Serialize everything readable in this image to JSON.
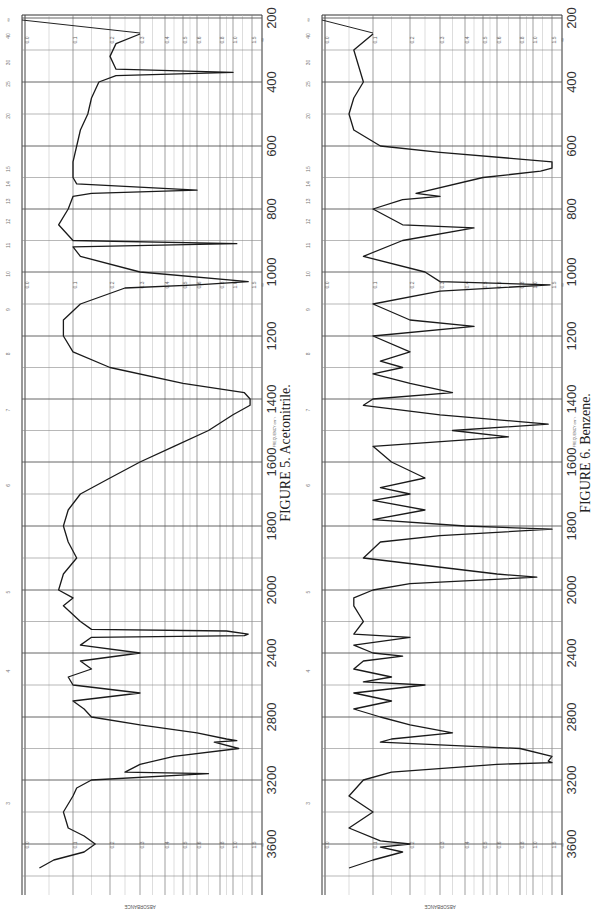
{
  "page": {
    "figures": [
      {
        "caption": "FIGURE 5.   Acetonitrile.",
        "compound": "Acetonitrile"
      },
      {
        "caption": "FIGURE 6.   Benzene.",
        "compound": "Benzene"
      }
    ],
    "frequency_axis_title": "FREQUENCY cm⁻¹",
    "absorbance_axis_title": "ABSORBANCE",
    "frequency_ticks": [
      "200",
      "400",
      "600",
      "800",
      "1000",
      "1200",
      "1400",
      "1600",
      "1800",
      "2000",
      "2400",
      "2800",
      "3200",
      "3600"
    ],
    "absorbance_ticks": [
      "0.0",
      "0.1",
      "0.2",
      "0.3",
      "0.4",
      "0.5",
      "0.6",
      "0.8",
      "1.0",
      "1.5",
      "∞"
    ],
    "micron_ticks": [
      "∞",
      "40",
      "30",
      "25",
      "20",
      "15",
      "14",
      "13",
      "12",
      "11",
      "10",
      "9",
      "8",
      "7",
      "6",
      "5",
      "4",
      "3"
    ]
  },
  "chart_data": [
    {
      "type": "line",
      "title": "FIGURE 5. Acetonitrile.",
      "xlabel": "FREQUENCY cm⁻¹",
      "ylabel": "ABSORBANCE",
      "orientation": "rotated 90° (frequency vertical, absorbance horizontal)",
      "x_ticks": [
        200,
        400,
        600,
        800,
        1000,
        1200,
        1400,
        1600,
        1800,
        2000,
        2400,
        2800,
        3200,
        3600
      ],
      "y_ticks": [
        0.0,
        0.1,
        0.2,
        0.3,
        0.4,
        0.5,
        0.6,
        0.8,
        1.0,
        1.5
      ],
      "xlim": [
        200,
        3800
      ],
      "ylim": [
        0.0,
        "∞"
      ],
      "grid": true,
      "series": [
        {
          "name": "Acetonitrile",
          "x": [
            250,
            280,
            320,
            360,
            370,
            380,
            400,
            450,
            500,
            550,
            600,
            650,
            700,
            720,
            740,
            750,
            760,
            800,
            850,
            900,
            910,
            920,
            950,
            1000,
            1030,
            1040,
            1050,
            1100,
            1150,
            1200,
            1250,
            1300,
            1350,
            1380,
            1400,
            1420,
            1450,
            1500,
            1550,
            1600,
            1650,
            1700,
            1750,
            1800,
            1850,
            1900,
            1950,
            2000,
            2050,
            2100,
            2200,
            2250,
            2260,
            2280,
            2290,
            2300,
            2350,
            2400,
            2450,
            2500,
            2550,
            2600,
            2650,
            2700,
            2750,
            2800,
            2850,
            2900,
            2940,
            2950,
            2960,
            3000,
            3050,
            3100,
            3150,
            3160,
            3200,
            3250,
            3300,
            3400,
            3500,
            3550,
            3600,
            3650,
            3700,
            3750
          ],
          "values": [
            0.3,
            0.22,
            0.2,
            0.22,
            1.0,
            0.22,
            0.17,
            0.15,
            0.14,
            0.12,
            0.11,
            0.1,
            0.1,
            0.11,
            0.6,
            0.15,
            0.1,
            0.09,
            0.07,
            0.1,
            1.1,
            0.1,
            0.12,
            0.3,
            1.4,
            0.6,
            0.25,
            0.12,
            0.08,
            0.08,
            0.1,
            0.2,
            0.5,
            1.3,
            1.45,
            1.45,
            1.0,
            0.7,
            0.45,
            0.3,
            0.2,
            0.12,
            0.09,
            0.08,
            0.09,
            0.11,
            0.08,
            0.07,
            0.1,
            0.08,
            0.12,
            0.15,
            0.9,
            1.4,
            1.3,
            0.15,
            0.12,
            0.3,
            0.12,
            0.15,
            0.09,
            0.1,
            0.3,
            0.1,
            0.13,
            0.15,
            0.3,
            0.6,
            0.9,
            1.1,
            0.75,
            1.15,
            0.45,
            0.3,
            0.25,
            0.7,
            0.15,
            0.11,
            0.1,
            0.08,
            0.09,
            0.13,
            0.16,
            0.13,
            0.06,
            0.03
          ]
        }
      ]
    },
    {
      "type": "line",
      "title": "FIGURE 6. Benzene.",
      "xlabel": "FREQUENCY cm⁻¹",
      "ylabel": "ABSORBANCE",
      "orientation": "rotated 90° (frequency vertical, absorbance horizontal)",
      "x_ticks": [
        200,
        400,
        600,
        800,
        1000,
        1200,
        1400,
        1600,
        1800,
        2000,
        2400,
        2800,
        3200,
        3600
      ],
      "y_ticks": [
        0.0,
        0.1,
        0.2,
        0.3,
        0.4,
        0.5,
        0.6,
        0.8,
        1.0,
        1.5
      ],
      "xlim": [
        200,
        3800
      ],
      "ylim": [
        0.0,
        "∞"
      ],
      "grid": true,
      "series": [
        {
          "name": "Benzene",
          "x": [
            250,
            300,
            350,
            400,
            450,
            500,
            550,
            600,
            620,
            650,
            670,
            680,
            700,
            750,
            760,
            770,
            800,
            850,
            860,
            900,
            950,
            1000,
            1030,
            1040,
            1060,
            1100,
            1150,
            1170,
            1200,
            1250,
            1280,
            1300,
            1320,
            1350,
            1380,
            1400,
            1420,
            1450,
            1480,
            1500,
            1520,
            1550,
            1600,
            1650,
            1680,
            1700,
            1720,
            1750,
            1780,
            1800,
            1810,
            1830,
            1850,
            1900,
            1950,
            1960,
            1980,
            2000,
            2050,
            2100,
            2200,
            2280,
            2300,
            2350,
            2400,
            2420,
            2450,
            2500,
            2550,
            2580,
            2600,
            2650,
            2700,
            2750,
            2800,
            2850,
            2900,
            2940,
            2960,
            3000,
            3050,
            3080,
            3090,
            3100,
            3150,
            3200,
            3300,
            3400,
            3500,
            3580,
            3600,
            3620,
            3650,
            3700,
            3750
          ],
          "values": [
            0.1,
            0.06,
            0.07,
            0.08,
            0.06,
            0.05,
            0.06,
            0.12,
            0.3,
            1.5,
            1.5,
            1.2,
            0.5,
            0.22,
            0.3,
            0.18,
            0.1,
            0.18,
            0.45,
            0.18,
            0.08,
            0.25,
            0.3,
            1.45,
            0.3,
            0.1,
            0.2,
            0.45,
            0.1,
            0.2,
            0.12,
            0.18,
            0.1,
            0.2,
            0.35,
            0.1,
            0.08,
            0.3,
            1.4,
            0.35,
            0.7,
            0.1,
            0.15,
            0.25,
            0.12,
            0.2,
            0.1,
            0.25,
            0.1,
            0.4,
            1.5,
            0.3,
            0.12,
            0.08,
            0.6,
            1.1,
            0.2,
            0.1,
            0.06,
            0.06,
            0.08,
            0.06,
            0.2,
            0.06,
            0.1,
            0.18,
            0.08,
            0.06,
            0.15,
            0.08,
            0.25,
            0.06,
            0.15,
            0.06,
            0.12,
            0.2,
            0.35,
            0.15,
            0.12,
            0.8,
            1.5,
            1.4,
            1.5,
            0.6,
            0.15,
            0.08,
            0.05,
            0.1,
            0.05,
            0.12,
            0.2,
            0.12,
            0.18,
            0.1,
            0.05
          ]
        }
      ]
    }
  ]
}
